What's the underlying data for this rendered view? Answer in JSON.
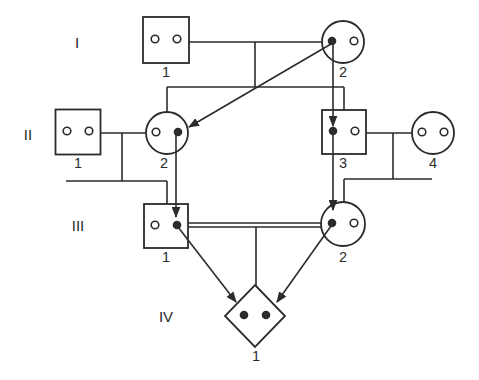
{
  "figure": {
    "width": 479,
    "height": 380,
    "background_color": "#ffffff",
    "stroke_color": "#2b2b2b",
    "line_width": 1.6,
    "symbol_stroke_width": 1.8
  },
  "generation_labels": [
    {
      "id": "gen-I",
      "text": "I",
      "x": 77,
      "y": 48
    },
    {
      "id": "gen-II",
      "text": "II",
      "x": 28,
      "y": 140
    },
    {
      "id": "gen-III",
      "text": "III",
      "x": 78,
      "y": 231
    },
    {
      "id": "gen-IV",
      "text": "IV",
      "x": 166,
      "y": 322
    }
  ],
  "individuals": [
    {
      "id": "I-1",
      "generation": "I",
      "number": "1",
      "sex": "male",
      "shape": "square",
      "cx": 166,
      "cy": 40,
      "size": 46,
      "alleles": [
        "open",
        "open"
      ],
      "label_x": 166,
      "label_y": 77
    },
    {
      "id": "I-2",
      "generation": "I",
      "number": "2",
      "sex": "female",
      "shape": "circle",
      "cx": 343,
      "cy": 42,
      "r": 21,
      "alleles": [
        "filled",
        "open"
      ],
      "label_x": 343,
      "label_y": 77
    },
    {
      "id": "II-1",
      "generation": "II",
      "number": "1",
      "sex": "male",
      "shape": "square",
      "cx": 78,
      "cy": 132,
      "size": 45,
      "alleles": [
        "open",
        "open"
      ],
      "label_x": 78,
      "label_y": 168
    },
    {
      "id": "II-2",
      "generation": "II",
      "number": "2",
      "sex": "female",
      "shape": "circle",
      "cx": 167,
      "cy": 133,
      "r": 21,
      "alleles": [
        "open",
        "filled"
      ],
      "label_x": 164,
      "label_y": 168
    },
    {
      "id": "II-3",
      "generation": "II",
      "number": "3",
      "sex": "male",
      "shape": "square",
      "cx": 344,
      "cy": 132,
      "size": 44,
      "alleles": [
        "filled",
        "open"
      ],
      "label_x": 343,
      "label_y": 168
    },
    {
      "id": "II-4",
      "generation": "II",
      "number": "4",
      "sex": "female",
      "shape": "circle",
      "cx": 433,
      "cy": 133,
      "r": 21,
      "alleles": [
        "open",
        "open"
      ],
      "label_x": 433,
      "label_y": 168
    },
    {
      "id": "III-1",
      "generation": "III",
      "number": "1",
      "sex": "male",
      "shape": "square",
      "cx": 166,
      "cy": 226,
      "size": 44,
      "alleles": [
        "open",
        "filled"
      ],
      "label_x": 166,
      "label_y": 262
    },
    {
      "id": "III-2",
      "generation": "III",
      "number": "2",
      "sex": "female",
      "shape": "circle",
      "cx": 343,
      "cy": 224,
      "r": 22,
      "alleles": [
        "filled",
        "open"
      ],
      "label_x": 343,
      "label_y": 262
    },
    {
      "id": "IV-1",
      "generation": "IV",
      "number": "1",
      "sex": "unknown",
      "shape": "diamond",
      "cx": 255,
      "cy": 316,
      "rx": 30,
      "ry": 31,
      "alleles": [
        "filled",
        "filled"
      ],
      "label_x": 256,
      "label_y": 361
    }
  ],
  "allele_style": {
    "offset_x": 11,
    "open_radius": 3.8,
    "filled_radius": 4.3
  },
  "lines": [
    {
      "name": "marriage-line-I1-I2",
      "x1": 189,
      "y1": 42,
      "x2": 322,
      "y2": 42
    },
    {
      "name": "descent-drop-gen-I",
      "x1": 255,
      "y1": 42,
      "x2": 255,
      "y2": 87
    },
    {
      "name": "sibship-line-gen-II",
      "x1": 167,
      "y1": 87,
      "x2": 344,
      "y2": 87
    },
    {
      "name": "descent-line-II2",
      "x1": 167,
      "y1": 87,
      "x2": 167,
      "y2": 112
    },
    {
      "name": "descent-line-II3",
      "x1": 344,
      "y1": 87,
      "x2": 344,
      "y2": 110
    },
    {
      "name": "marriage-line-II1-II2",
      "x1": 100,
      "y1": 133,
      "x2": 146,
      "y2": 133
    },
    {
      "name": "descent-drop-II-left",
      "x1": 122,
      "y1": 133,
      "x2": 122,
      "y2": 181
    },
    {
      "name": "sibship-line-III-left",
      "x1": 66,
      "y1": 181,
      "x2": 167,
      "y2": 181
    },
    {
      "name": "descent-line-III1",
      "x1": 167,
      "y1": 181,
      "x2": 167,
      "y2": 204
    },
    {
      "name": "marriage-line-II3-II4",
      "x1": 366,
      "y1": 133,
      "x2": 412,
      "y2": 133
    },
    {
      "name": "descent-drop-II-right",
      "x1": 393,
      "y1": 133,
      "x2": 393,
      "y2": 179
    },
    {
      "name": "sibship-line-III-right",
      "x1": 344,
      "y1": 179,
      "x2": 432,
      "y2": 179
    },
    {
      "name": "descent-line-III2",
      "x1": 344,
      "y1": 179,
      "x2": 344,
      "y2": 202
    },
    {
      "name": "consanguinity-line-upper",
      "x1": 188,
      "y1": 223,
      "x2": 321,
      "y2": 223
    },
    {
      "name": "consanguinity-line-lower",
      "x1": 188,
      "y1": 227,
      "x2": 321,
      "y2": 227
    },
    {
      "name": "descent-line-IV1",
      "x1": 256,
      "y1": 227,
      "x2": 256,
      "y2": 286
    }
  ],
  "arrows": [
    {
      "name": "transmission-arrow-I2-to-II2",
      "x1": 331,
      "y1": 44,
      "x2": 189,
      "y2": 127
    },
    {
      "name": "transmission-arrow-I2-to-II3",
      "x1": 333,
      "y1": 44,
      "x2": 333,
      "y2": 126
    },
    {
      "name": "transmission-arrow-II2-to-III1",
      "x1": 176,
      "y1": 135,
      "x2": 176,
      "y2": 217
    },
    {
      "name": "transmission-arrow-II3-to-III2",
      "x1": 333,
      "y1": 135,
      "x2": 333,
      "y2": 210
    },
    {
      "name": "transmission-arrow-III1-to-IV1",
      "x1": 178,
      "y1": 227,
      "x2": 236,
      "y2": 302
    },
    {
      "name": "transmission-arrow-III2-to-IV1",
      "x1": 331,
      "y1": 226,
      "x2": 277,
      "y2": 302
    }
  ]
}
